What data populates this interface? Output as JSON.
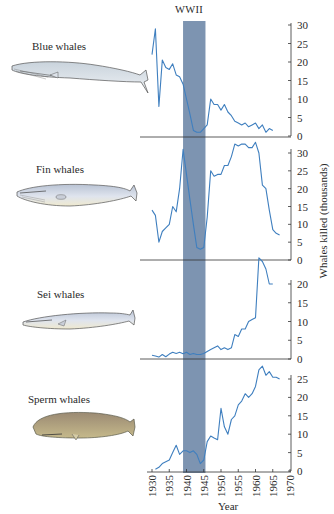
{
  "figure": {
    "wwii_label": "WWII",
    "y_axis_label": "Whales killed (thousands)",
    "x_axis_label": "Year",
    "x_ticks": [
      "1930",
      "1935",
      "1940",
      "1945",
      "1950",
      "1955",
      "1960",
      "1965",
      "1970"
    ],
    "wwii_band": [
      1939,
      1945.5
    ],
    "line_color": "#3f7fbf",
    "band_color": "#6f88a8",
    "species": [
      {
        "label": "Blue whales"
      },
      {
        "label": "Fin whales"
      },
      {
        "label": "Sei whales"
      },
      {
        "label": "Sperm whales"
      }
    ]
  },
  "chart_data": [
    {
      "type": "line",
      "title": "Blue whales",
      "xlabel": "Year",
      "ylabel": "Whales killed (thousands)",
      "xlim": [
        1930,
        1970
      ],
      "ylim": [
        0,
        30
      ],
      "yticks": [
        0,
        5,
        10,
        15,
        20,
        25,
        30
      ],
      "annotation": "WWII (1939-1945)",
      "x": [
        1930,
        1931,
        1932,
        1933,
        1934,
        1935,
        1936,
        1937,
        1938,
        1939,
        1940,
        1941,
        1942,
        1943,
        1944,
        1945,
        1946,
        1947,
        1948,
        1949,
        1950,
        1951,
        1952,
        1953,
        1954,
        1955,
        1956,
        1957,
        1958,
        1959,
        1960,
        1961,
        1962,
        1963,
        1964,
        1965
      ],
      "values": [
        22,
        29,
        8,
        20.5,
        18.5,
        18,
        19.5,
        16.5,
        16,
        14,
        10,
        6,
        1.5,
        1,
        1,
        2,
        3,
        10,
        8.5,
        8.5,
        7,
        8.5,
        6.5,
        5.5,
        4,
        3.5,
        3,
        3.5,
        2.5,
        3,
        3.5,
        2,
        3,
        1,
        2,
        1.5
      ]
    },
    {
      "type": "line",
      "title": "Fin whales",
      "xlabel": "Year",
      "ylabel": "Whales killed (thousands)",
      "xlim": [
        1930,
        1970
      ],
      "ylim": [
        0,
        30
      ],
      "yticks": [
        0,
        5,
        10,
        15,
        20,
        25,
        30
      ],
      "x": [
        1930,
        1931,
        1932,
        1933,
        1934,
        1935,
        1936,
        1937,
        1938,
        1939,
        1940,
        1941,
        1942,
        1943,
        1944,
        1945,
        1946,
        1947,
        1948,
        1949,
        1950,
        1951,
        1952,
        1953,
        1954,
        1955,
        1956,
        1957,
        1958,
        1959,
        1960,
        1961,
        1962,
        1963,
        1964,
        1965,
        1966,
        1967
      ],
      "values": [
        14,
        12.5,
        5,
        8,
        9,
        10,
        15,
        13.5,
        20,
        31,
        24,
        17,
        10,
        3.5,
        3,
        3.5,
        12,
        25,
        23.5,
        24,
        24,
        26.5,
        26.5,
        29,
        32.5,
        32,
        32.5,
        32.5,
        31.5,
        31.5,
        33,
        30,
        21,
        20,
        14,
        8.5,
        7.5,
        7
      ]
    },
    {
      "type": "line",
      "title": "Sei whales",
      "xlabel": "Year",
      "ylabel": "Whales killed (thousands)",
      "xlim": [
        1930,
        1970
      ],
      "ylim": [
        0,
        25
      ],
      "yticks": [
        0,
        5,
        10,
        15,
        20
      ],
      "x": [
        1930,
        1931,
        1932,
        1933,
        1934,
        1935,
        1936,
        1937,
        1938,
        1939,
        1940,
        1941,
        1942,
        1943,
        1944,
        1945,
        1946,
        1947,
        1948,
        1949,
        1950,
        1951,
        1952,
        1953,
        1954,
        1955,
        1956,
        1957,
        1958,
        1959,
        1960,
        1961,
        1962,
        1963,
        1964,
        1965
      ],
      "values": [
        1,
        0.8,
        0.5,
        1.2,
        0.6,
        1.3,
        1.8,
        1.5,
        1.8,
        1.4,
        1.8,
        1.2,
        1.5,
        1.2,
        1.2,
        1.5,
        2,
        2.5,
        3,
        3.5,
        2.5,
        3,
        2.5,
        3,
        6.5,
        6,
        8,
        8,
        10,
        10.5,
        11,
        27,
        26,
        24,
        20,
        20
      ]
    },
    {
      "type": "line",
      "title": "Sperm whales",
      "xlabel": "Year",
      "ylabel": "Whales killed (thousands)",
      "xlim": [
        1930,
        1970
      ],
      "ylim": [
        0,
        30
      ],
      "yticks": [
        0,
        5,
        10,
        15,
        20,
        25
      ],
      "x": [
        1931,
        1932,
        1933,
        1934,
        1935,
        1936,
        1937,
        1938,
        1939,
        1940,
        1941,
        1942,
        1943,
        1944,
        1945,
        1946,
        1947,
        1948,
        1949,
        1950,
        1951,
        1952,
        1953,
        1954,
        1955,
        1956,
        1957,
        1958,
        1959,
        1960,
        1961,
        1962,
        1963,
        1964,
        1965,
        1966,
        1967
      ],
      "values": [
        0.5,
        1,
        2,
        2.5,
        3,
        5,
        7,
        4.5,
        5.5,
        5.5,
        5,
        5.5,
        4.5,
        2,
        3,
        8,
        9.5,
        9,
        8.5,
        17,
        12,
        10,
        14,
        15,
        18,
        19,
        21,
        20,
        21,
        23,
        27.5,
        28.5,
        26,
        27,
        25.5,
        25.5,
        25
      ]
    }
  ]
}
